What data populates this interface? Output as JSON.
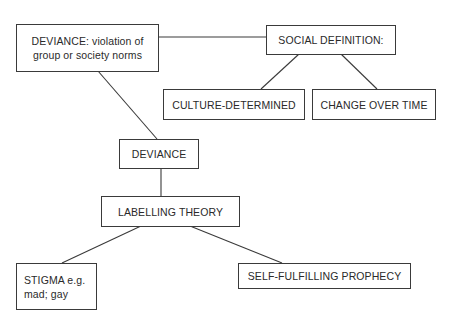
{
  "diagram": {
    "nodes": {
      "deviance_definition": "DEVIANCE: violation of\ngroup or society norms",
      "social_definition": "SOCIAL DEFINITION:",
      "culture_determined": "CULTURE-DETERMINED",
      "change_over_time": "CHANGE OVER TIME",
      "deviance": "DEVIANCE",
      "labelling_theory": "LABELLING THEORY",
      "stigma": "STIGMA e.g.\nmad; gay",
      "self_fulfilling_prophecy": "SELF-FULFILLING PROPHECY"
    },
    "edges": [
      [
        "deviance_definition",
        "social_definition"
      ],
      [
        "social_definition",
        "culture_determined"
      ],
      [
        "social_definition",
        "change_over_time"
      ],
      [
        "deviance_definition",
        "deviance"
      ],
      [
        "deviance",
        "labelling_theory"
      ],
      [
        "labelling_theory",
        "stigma"
      ],
      [
        "labelling_theory",
        "self_fulfilling_prophecy"
      ]
    ]
  }
}
